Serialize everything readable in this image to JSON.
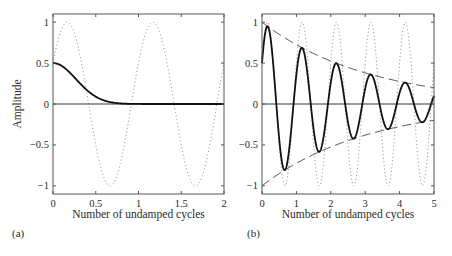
{
  "figure": {
    "panels": [
      {
        "id": "a",
        "panel_label": "(a)",
        "xlabel": "Number of undamped cycles",
        "ylabel": "Amplitude",
        "xlim": [
          0,
          2
        ],
        "ylim": [
          -1.1,
          1.1
        ],
        "xticks": [
          0,
          0.5,
          1,
          1.5,
          2
        ],
        "xtick_labels": [
          "0",
          "0.5",
          "1",
          "1.5",
          "2"
        ],
        "yticks": [
          -1,
          -0.5,
          0,
          0.5,
          1
        ],
        "ytick_labels": [
          "−1",
          "−0.5",
          "0",
          "0.5",
          "1"
        ]
      },
      {
        "id": "b",
        "panel_label": "(b)",
        "xlabel": "Number of undamped cycles",
        "ylabel": "",
        "xlim": [
          0,
          5
        ],
        "ylim": [
          -1.1,
          1.1
        ],
        "xticks": [
          0,
          1,
          2,
          3,
          4,
          5
        ],
        "xtick_labels": [
          "0",
          "1",
          "2",
          "3",
          "4",
          "5"
        ],
        "yticks": [
          -1,
          -0.5,
          0,
          0.5,
          1
        ],
        "ytick_labels": [
          "−1",
          "−0.5",
          "0",
          "0.5",
          "1"
        ]
      }
    ],
    "colors": {
      "solid": "#111111",
      "dotted": "#8a8a8a",
      "dashed": "#444444",
      "axes": "#555555",
      "zero_line": "#333333"
    }
  },
  "chart_data": [
    {
      "type": "line",
      "panel": "(a)",
      "title": "",
      "xlabel": "Number of undamped cycles",
      "ylabel": "Amplitude",
      "xlim": [
        0,
        2
      ],
      "ylim": [
        -1,
        1
      ],
      "grid": false,
      "legend": null,
      "x": [
        0,
        0.1,
        0.2,
        0.3,
        0.4,
        0.5,
        0.6,
        0.7,
        0.8,
        0.9,
        1.0,
        1.1,
        1.2,
        1.3,
        1.4,
        1.5,
        1.6,
        1.7,
        1.8,
        1.9,
        2.0
      ],
      "series": [
        {
          "name": "undamped oscillation (dotted)",
          "style": "dotted",
          "values": [
            0.5,
            0.914,
            0.978,
            0.669,
            0.105,
            -0.5,
            -0.914,
            -0.978,
            -0.669,
            -0.105,
            0.5,
            0.914,
            0.978,
            0.669,
            0.105,
            -0.5,
            -0.914,
            -0.978,
            -0.669,
            -0.105,
            0.5
          ]
        },
        {
          "name": "overdamped response (solid)",
          "style": "solid",
          "values": [
            0.5,
            0.467,
            0.38,
            0.27,
            0.167,
            0.09,
            0.042,
            0.017,
            0.006,
            0.002,
            0.0,
            0.0,
            0.0,
            0.0,
            0.0,
            0.0,
            0.0,
            0.0,
            0.0,
            0.0,
            0.0
          ]
        }
      ]
    },
    {
      "type": "line",
      "panel": "(b)",
      "title": "",
      "xlabel": "Number of undamped cycles",
      "ylabel": "",
      "xlim": [
        0,
        5
      ],
      "ylim": [
        -1,
        1
      ],
      "grid": false,
      "legend": null,
      "x": [
        0,
        0.25,
        0.5,
        0.75,
        1.0,
        1.25,
        1.5,
        1.75,
        2.0,
        2.25,
        2.5,
        2.75,
        3.0,
        3.25,
        3.5,
        3.75,
        4.0,
        4.25,
        4.5,
        4.75,
        5.0
      ],
      "series": [
        {
          "name": "undamped oscillation (dotted)",
          "style": "dotted",
          "values": [
            0.5,
            0.866,
            -0.5,
            -0.866,
            0.5,
            0.866,
            -0.5,
            -0.866,
            0.5,
            0.866,
            -0.5,
            -0.866,
            0.5,
            0.866,
            -0.5,
            -0.866,
            0.5,
            0.866,
            -0.5,
            -0.866,
            0.5
          ]
        },
        {
          "name": "damped oscillation (solid)",
          "style": "solid",
          "values": [
            0.5,
            0.799,
            -0.426,
            -0.68,
            0.362,
            0.579,
            -0.309,
            -0.493,
            0.263,
            0.42,
            -0.224,
            -0.358,
            0.19,
            0.304,
            -0.162,
            -0.259,
            0.138,
            0.221,
            -0.118,
            -0.188,
            0.1
          ]
        },
        {
          "name": "upper envelope (dashed)",
          "style": "dashed",
          "values": [
            1.0,
            0.923,
            0.851,
            0.785,
            0.725,
            0.669,
            0.617,
            0.569,
            0.525,
            0.485,
            0.447,
            0.413,
            0.381,
            0.351,
            0.324,
            0.299,
            0.276,
            0.255,
            0.235,
            0.217,
            0.2
          ]
        },
        {
          "name": "lower envelope (dashed)",
          "style": "dashed",
          "values": [
            -1.0,
            -0.923,
            -0.851,
            -0.785,
            -0.725,
            -0.669,
            -0.617,
            -0.569,
            -0.525,
            -0.485,
            -0.447,
            -0.413,
            -0.381,
            -0.351,
            -0.324,
            -0.299,
            -0.276,
            -0.255,
            -0.235,
            -0.217,
            -0.2
          ]
        }
      ]
    }
  ]
}
